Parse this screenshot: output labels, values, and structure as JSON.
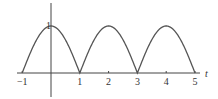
{
  "chart_data": {
    "type": "line",
    "title": "",
    "function": "|cos(pi*t/2)|",
    "xlabel": "t",
    "ylabel": "",
    "xlim": [
      -1,
      5
    ],
    "ylim": [
      0,
      1
    ],
    "grid": false,
    "legend": null,
    "x_ticks": [
      "-1",
      "1",
      "2",
      "3",
      "4",
      "5"
    ],
    "y_ticks": [
      "1"
    ],
    "series": [
      {
        "name": "f(t)",
        "x": [
          -1,
          -0.5,
          0,
          0.5,
          1,
          1.5,
          2,
          2.5,
          3,
          3.5,
          4,
          4.5,
          5
        ],
        "values": [
          0,
          0.707,
          1,
          0.707,
          0,
          0.707,
          1,
          0.707,
          0,
          0.707,
          1,
          0.707,
          0
        ]
      }
    ],
    "colors": {
      "curve": "#555555",
      "axis": "#444444",
      "text": "#333333"
    }
  }
}
